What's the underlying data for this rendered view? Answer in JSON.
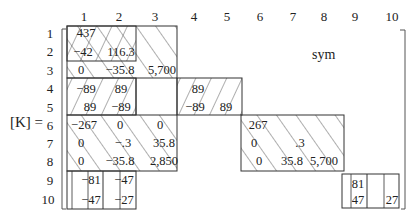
{
  "figure": {
    "label": "[K] =",
    "symmetry_note": "sym",
    "column_headers": [
      "1",
      "2",
      "3",
      "4",
      "5",
      "6",
      "7",
      "8",
      "9",
      "10"
    ],
    "row_headers": [
      "1",
      "2",
      "3",
      "4",
      "5",
      "6",
      "7",
      "8",
      "9",
      "10"
    ],
    "entries": {
      "r1c1": "437",
      "r2c1": "−42",
      "r2c2": "116.3",
      "r3c1": "0",
      "r3c2": "−35.8",
      "r3c3": "5,700",
      "r4c1": "−89",
      "r4c2": "89",
      "r5c1": "89",
      "r5c2": "−89",
      "r4c4": "89",
      "r5c4": "−89",
      "r5c5": "89",
      "r6c1": "−267",
      "r6c2": "0",
      "r6c3": "0",
      "r7c1": "0",
      "r7c2": "−.3",
      "r7c3": "35.8",
      "r8c1": "0",
      "r8c2": "−35.8",
      "r8c3": "2,850",
      "r6c6": "267",
      "r7c6": "0",
      "r7c7": ".3",
      "r8c6": "0",
      "r8c7": "35.8",
      "r8c8": "5,700",
      "r9c1": "−81",
      "r9c2": "−47",
      "r10c1": "−47",
      "r10c2": "−27",
      "r9c9": "81",
      "r10c9": "47",
      "r10c10": "27"
    }
  }
}
